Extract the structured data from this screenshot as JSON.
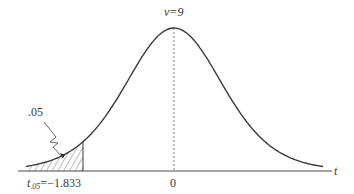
{
  "chart_data": {
    "type": "line",
    "title": "",
    "distribution": "t",
    "degrees_of_freedom_label": "ν=9",
    "degrees_of_freedom": 9,
    "xlabel": "t",
    "ylabel": "",
    "x_ticks": [
      {
        "value": 0,
        "label": "0"
      }
    ],
    "critical_value": {
      "symbol": "t",
      "subscript": ".05",
      "equals": "=",
      "value": -1.833,
      "label": "−1.833"
    },
    "shaded_region": {
      "side": "left",
      "from": "-inf",
      "to": -1.833,
      "area": 0.05,
      "area_label": ".05",
      "pattern": "diagonal-hatch"
    },
    "center_line": {
      "x": 0,
      "style": "dashed"
    },
    "grid": false,
    "legend": null
  },
  "colors": {
    "curve": "#3a3a3a",
    "axis": "#4a4a4a",
    "hatch": "#555555",
    "background": "#ffffff"
  }
}
